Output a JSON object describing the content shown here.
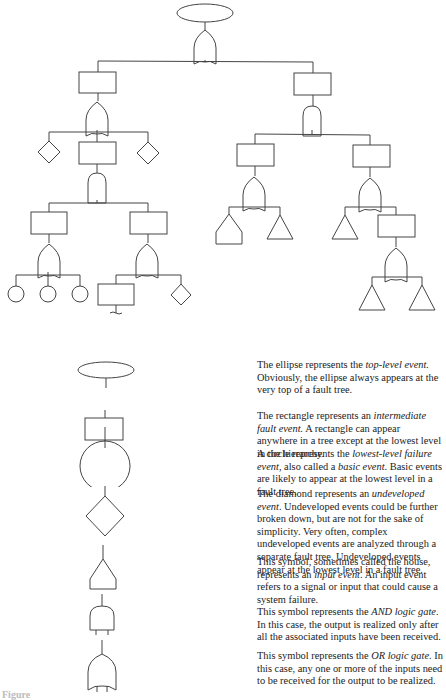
{
  "diagram": {
    "type": "fault-tree",
    "colors": {
      "stroke": "#444444",
      "text": "#222222",
      "background": "#ffffff"
    },
    "tree": {
      "root": {
        "symbol": "ellipse",
        "gate": "OR"
      },
      "left_branch": {
        "symbol": "rectangle",
        "gate": "OR",
        "children": [
          "diamond",
          "rectangle",
          "diamond"
        ],
        "middle_rectangle_gate": "AND",
        "sub": [
          {
            "symbol": "rectangle",
            "gate": "OR",
            "children": [
              "circle",
              "circle",
              "circle"
            ]
          },
          {
            "symbol": "rectangle",
            "gate": "OR",
            "children": [
              "rectangle (transfer)",
              "diamond"
            ]
          }
        ]
      },
      "right_branch": {
        "symbol": "rectangle",
        "gate": "AND",
        "sub": [
          {
            "symbol": "rectangle",
            "gate": "OR",
            "children": [
              "house",
              "triangle"
            ]
          },
          {
            "symbol": "rectangle",
            "gate": "OR",
            "children": [
              "triangle",
              "rectangle"
            ],
            "rectangle_gate": "OR",
            "rectangle_children": [
              "triangle",
              "triangle"
            ]
          }
        ]
      }
    }
  },
  "legend": [
    {
      "symbol": "ellipse",
      "text_parts": [
        "The ellipse represents the ",
        "top-level event.",
        " Obviously, the ellipse always appears at the very top of a fault tree."
      ]
    },
    {
      "symbol": "rectangle",
      "text_parts": [
        "The rectangle represents an ",
        "intermediate fault event.",
        " A rectangle can appear anywhere in a tree except at the lowest level in the hierarchy."
      ]
    },
    {
      "symbol": "circle",
      "text_parts": [
        "A circle represents the ",
        "lowest-level failure event",
        ", also called a ",
        "basic event",
        ". Basic events are likely to appear at the lowest level in a fault tree."
      ]
    },
    {
      "symbol": "diamond",
      "text_parts": [
        "The diamond represents an ",
        "undeveloped event",
        ". Undeveloped events could be further broken down, but are not for the sake of simplicity. Very often, complex undeveloped events are analyzed through a separate fault tree. Undeveloped events appear at the lowest level in a fault tree."
      ]
    },
    {
      "symbol": "house",
      "text_parts": [
        "This symbol, sometimes called the house, represents an ",
        "input event",
        ". An input event refers to a signal or input that could cause a system failure."
      ]
    },
    {
      "symbol": "and-gate",
      "text_parts": [
        "This symbol represents the ",
        "AND logic gate",
        ". In this case, the output is realized only after all the associated inputs have been received."
      ]
    },
    {
      "symbol": "or-gate",
      "text_parts": [
        "This symbol represents the ",
        "OR logic gate",
        ". In this case, any one or more of the inputs need to be received for the output to be realized."
      ]
    }
  ],
  "caption": "Figure"
}
